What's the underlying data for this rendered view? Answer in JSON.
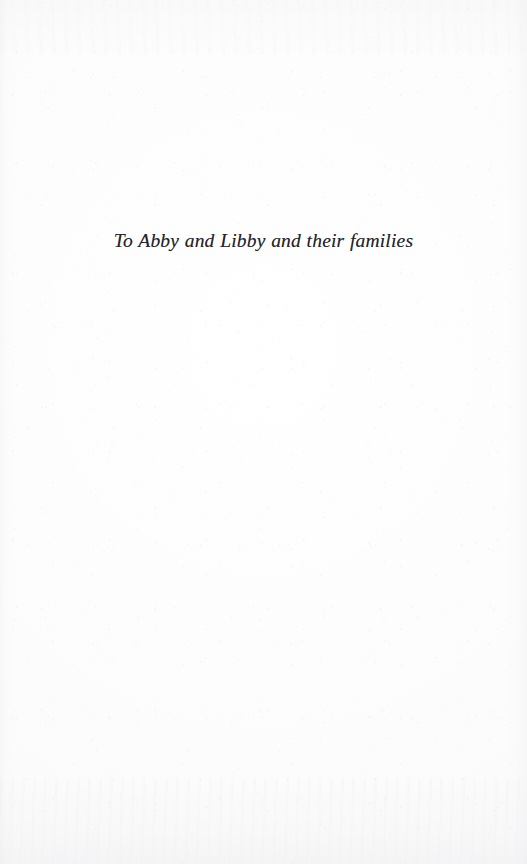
{
  "page": {
    "type": "dedication-page",
    "background_color": "#fdfdfd",
    "ink_color": "#24242a"
  },
  "dedication": {
    "text": "To Abby and Libby and their families"
  }
}
